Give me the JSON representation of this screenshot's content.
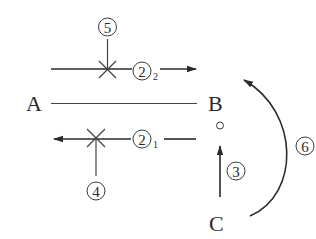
{
  "diagram": {
    "type": "pathway-schematic",
    "nodes": {
      "A": {
        "label": "A"
      },
      "B": {
        "label": "B"
      },
      "C": {
        "label": "C"
      }
    },
    "markers": {
      "m5": {
        "label": "5",
        "display": "⑤"
      },
      "m2_2": {
        "label": "2",
        "display": "②",
        "subscript": "2"
      },
      "m2_1": {
        "label": "2",
        "display": "②",
        "subscript": "1"
      },
      "m4": {
        "label": "4",
        "display": "④"
      },
      "m3": {
        "label": "3",
        "display": "③"
      },
      "m6": {
        "label": "6",
        "display": "⑥"
      }
    },
    "edges": [
      {
        "id": "A-B",
        "from": "A",
        "to": "B",
        "style": "line"
      },
      {
        "id": "2_2",
        "direction": "right",
        "label": "②2",
        "blocked_by": "⑤"
      },
      {
        "id": "2_1",
        "direction": "left",
        "label": "②1",
        "blocked_by": "④"
      },
      {
        "id": "3",
        "from": "C",
        "to": "B",
        "direction": "up",
        "label": "③"
      },
      {
        "id": "6",
        "from": "C",
        "to": "B",
        "style": "curved-arrow",
        "label": "⑥"
      }
    ],
    "colors": {
      "ink": "#2a2a2a",
      "background": "#ffffff"
    }
  }
}
